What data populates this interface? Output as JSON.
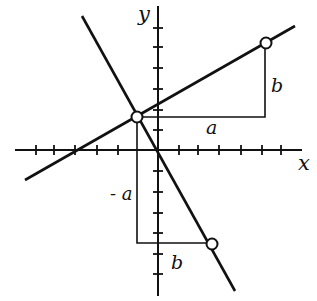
{
  "diagram": {
    "title": "",
    "axes": {
      "x_label": "x",
      "y_label": "y",
      "origin_px": [
        158,
        150
      ],
      "x_ticks_px": [
        36,
        54,
        75,
        97,
        118,
        137,
        179,
        198,
        219,
        241,
        262,
        281
      ],
      "y_ticks_px": [
        28,
        47,
        68,
        89,
        110,
        130,
        171,
        192,
        213,
        233,
        254,
        274
      ]
    },
    "lines": [
      {
        "name": "line-positive-slope",
        "from": [
          25,
          180
        ],
        "to": [
          295,
          26
        ]
      },
      {
        "name": "line-negative-slope",
        "from": [
          82,
          16
        ],
        "to": [
          235,
          291
        ]
      }
    ],
    "points": [
      {
        "name": "intersection-point",
        "at": [
          137,
          117
        ]
      },
      {
        "name": "upper-right-point",
        "at": [
          266,
          43
        ]
      },
      {
        "name": "lower-right-point",
        "at": [
          212,
          244
        ]
      }
    ],
    "labels": {
      "run_upper": "a",
      "rise_upper": "b",
      "run_lower": "- a",
      "rise_lower": "b"
    },
    "colors": {
      "ink": "#111111",
      "background": "#ffffff"
    }
  }
}
